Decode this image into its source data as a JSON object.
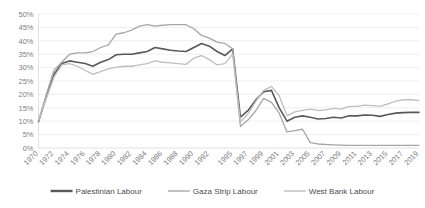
{
  "chart_data": {
    "type": "line",
    "title": "",
    "subtitle": "",
    "xlabel": "",
    "ylabel": "",
    "ylim": [
      0,
      50
    ],
    "xlim": [
      1970,
      2019
    ],
    "grid": true,
    "y_tick_labels": [
      "0%",
      "5%",
      "10%",
      "15%",
      "20%",
      "25%",
      "30%",
      "35%",
      "40%",
      "45%",
      "50%"
    ],
    "y_tick_values": [
      0,
      5,
      10,
      15,
      20,
      25,
      30,
      35,
      40,
      45,
      50
    ],
    "x_tick_labels": [
      "1970",
      "1972",
      "1974",
      "1976",
      "1978",
      "1980",
      "1982",
      "1984",
      "1986",
      "1988",
      "1990",
      "1992",
      "1995",
      "1997",
      "1999",
      "2001",
      "2003",
      "2005",
      "2007",
      "2009",
      "2011",
      "2013",
      "2015",
      "2017",
      "2019"
    ],
    "x": [
      1970,
      1971,
      1972,
      1973,
      1974,
      1975,
      1976,
      1977,
      1978,
      1979,
      1980,
      1981,
      1982,
      1983,
      1984,
      1985,
      1986,
      1987,
      1988,
      1989,
      1990,
      1991,
      1992,
      1993,
      1994,
      1995,
      1996,
      1997,
      1998,
      1999,
      2000,
      2001,
      2002,
      2003,
      2004,
      2005,
      2006,
      2007,
      2008,
      2009,
      2010,
      2011,
      2012,
      2013,
      2014,
      2015,
      2016,
      2017,
      2018,
      2019
    ],
    "legend_position": "bottom",
    "series": [
      {
        "name": "Palestinian Labour",
        "color": "#595959",
        "width": 1.6,
        "values": [
          10.0,
          19.0,
          27.5,
          31.5,
          32.5,
          32.0,
          31.5,
          30.5,
          32.0,
          33.0,
          34.8,
          35.0,
          35.0,
          35.5,
          36.0,
          37.5,
          37.0,
          36.5,
          36.2,
          36.0,
          37.5,
          39.0,
          38.0,
          36.0,
          34.5,
          37.0,
          11.5,
          14.0,
          18.0,
          21.0,
          21.5,
          15.0,
          10.0,
          11.5,
          12.0,
          11.5,
          10.8,
          11.0,
          11.5,
          11.2,
          12.0,
          12.0,
          12.3,
          12.2,
          11.8,
          12.5,
          13.0,
          13.2,
          13.3,
          13.3
        ]
      },
      {
        "name": "Gaza Strip Labour",
        "color": "#a6a6a6",
        "width": 1.3,
        "values": [
          9.5,
          20.0,
          29.0,
          32.0,
          35.0,
          35.5,
          35.5,
          36.0,
          37.5,
          38.5,
          42.5,
          43.0,
          44.0,
          45.5,
          46.0,
          45.5,
          45.8,
          46.0,
          46.0,
          46.0,
          44.5,
          42.0,
          41.0,
          39.5,
          39.0,
          37.0,
          8.0,
          10.5,
          14.0,
          18.5,
          17.0,
          13.0,
          6.0,
          6.5,
          7.0,
          2.0,
          1.5,
          1.3,
          1.2,
          1.1,
          1.0,
          1.0,
          1.0,
          1.0,
          1.0,
          1.0,
          1.0,
          1.0,
          1.0,
          1.0
        ]
      },
      {
        "name": "West Bank Labour",
        "color": "#bfbfbf",
        "width": 1.3,
        "values": [
          10.5,
          18.5,
          26.5,
          31.0,
          31.5,
          30.5,
          29.0,
          27.5,
          28.5,
          29.5,
          30.2,
          30.5,
          30.5,
          31.0,
          31.5,
          32.5,
          32.0,
          31.8,
          31.5,
          31.2,
          33.5,
          34.5,
          33.0,
          31.0,
          31.5,
          35.0,
          9.8,
          12.8,
          17.5,
          21.5,
          23.0,
          19.5,
          12.0,
          13.5,
          14.0,
          14.5,
          14.0,
          14.2,
          14.8,
          14.5,
          15.5,
          15.5,
          16.0,
          15.8,
          15.5,
          16.5,
          17.5,
          18.0,
          18.0,
          17.8
        ]
      }
    ]
  },
  "legend": {
    "items": [
      {
        "label": "Palestinian Labour",
        "color": "#595959",
        "width": 2.4
      },
      {
        "label": "Gaza Strip Labour",
        "color": "#a6a6a6",
        "width": 1.4
      },
      {
        "label": "West Bank Labour",
        "color": "#bfbfbf",
        "width": 1.4
      }
    ]
  },
  "colors": {
    "background": "#ffffff",
    "gridline": "#e8e8e8",
    "axis": "#d9d9d9",
    "tick_label": "#808080",
    "legend_label": "#4d4d4d"
  }
}
